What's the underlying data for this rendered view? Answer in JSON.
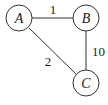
{
  "graph": {
    "nodes": [
      {
        "id": "A",
        "label": "A",
        "x": 19,
        "y": 18
      },
      {
        "id": "B",
        "label": "B",
        "x": 86,
        "y": 18
      },
      {
        "id": "C",
        "label": "C",
        "x": 86,
        "y": 83
      }
    ],
    "edges": [
      {
        "from": "A",
        "to": "B",
        "weight": "1"
      },
      {
        "from": "A",
        "to": "C",
        "weight": "2"
      },
      {
        "from": "B",
        "to": "C",
        "weight": "10"
      }
    ]
  }
}
